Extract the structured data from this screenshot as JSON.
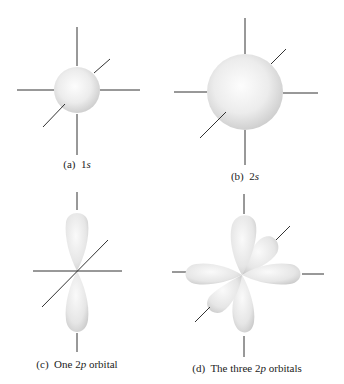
{
  "figure": {
    "panels": [
      {
        "id": "a",
        "letter": "(a)",
        "label_pre": "1",
        "label_em": "s",
        "label_post": "",
        "type": "1s orbital"
      },
      {
        "id": "b",
        "letter": "(b)",
        "label_pre": "2",
        "label_em": "s",
        "label_post": "",
        "type": "2s orbital"
      },
      {
        "id": "c",
        "letter": "(c)",
        "label_pre": "One 2",
        "label_em": "p",
        "label_post": " orbital",
        "type": "single 2p orbital"
      },
      {
        "id": "d",
        "letter": "(d)",
        "label_pre": "The three 2",
        "label_em": "p",
        "label_post": " orbitals",
        "type": "three 2p orbitals"
      }
    ],
    "colors": {
      "axis": "#333333",
      "orbital_light": "#fbfbfb",
      "orbital_dark": "#cfcfcf"
    }
  }
}
